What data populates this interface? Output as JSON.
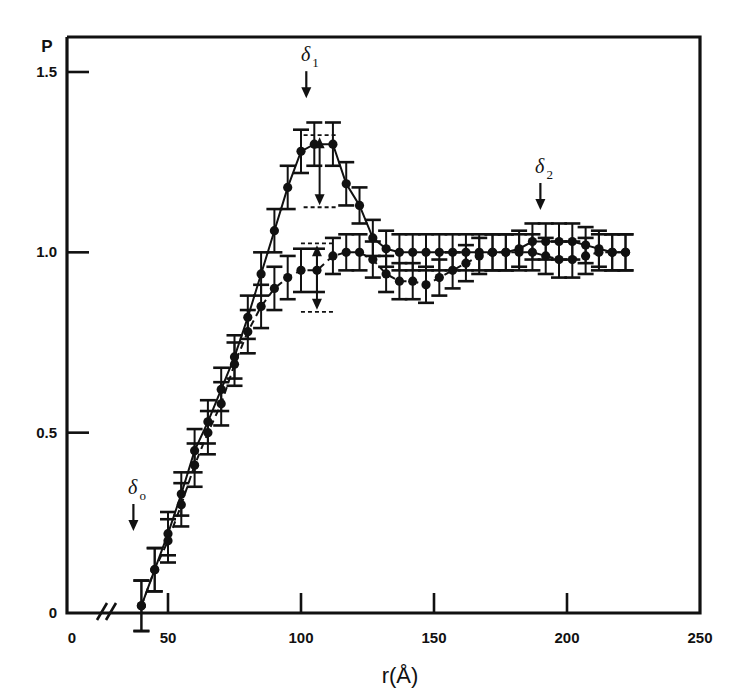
{
  "chart_data": {
    "type": "scatter",
    "title": "",
    "xlabel": "r(Å)",
    "ylabel": "P",
    "xlim": [
      0,
      250
    ],
    "ylim": [
      0,
      1.65
    ],
    "grid": false,
    "legend": "none",
    "axis_break_x": true,
    "x_ticks": [
      0,
      50,
      100,
      150,
      200,
      250
    ],
    "x_tick_labels": [
      "0",
      "50",
      "100",
      "150",
      "200",
      "250"
    ],
    "y_ticks": [
      0,
      0.5,
      1.0,
      1.5
    ],
    "y_tick_labels": [
      "0",
      "0.5",
      "1.0",
      "1.5"
    ],
    "annotations": [
      {
        "name": "delta-0",
        "label": "δ",
        "sub": "o",
        "x": 40,
        "y_label": 0.33,
        "arrow": "down"
      },
      {
        "name": "delta-1",
        "label": "δ",
        "sub": "1",
        "x": 105,
        "y_label": 1.53,
        "arrow": "down"
      },
      {
        "name": "delta-2",
        "label": "δ",
        "sub": "2",
        "x": 193,
        "y_label": 1.22,
        "arrow": "down"
      }
    ],
    "markers": [
      {
        "name": "spread-marker-upper",
        "x": 107,
        "y_top": 1.3,
        "y_bottom": 1.15
      },
      {
        "name": "spread-marker-lower",
        "x": 106,
        "y_top": 1.0,
        "y_bottom": 0.86
      }
    ],
    "series": [
      {
        "name": "upper-curve",
        "line_style": "solid",
        "x": [
          40,
          45,
          50,
          55,
          60,
          65,
          70,
          75,
          80,
          85,
          90,
          95,
          100,
          105,
          112,
          117,
          122,
          127,
          132,
          137,
          142,
          147,
          152,
          157,
          162,
          167,
          172,
          177,
          182,
          187,
          192,
          197,
          202,
          207,
          212,
          217,
          222
        ],
        "y": [
          0.02,
          0.12,
          0.22,
          0.33,
          0.45,
          0.53,
          0.62,
          0.71,
          0.82,
          0.94,
          1.06,
          1.18,
          1.28,
          1.3,
          1.3,
          1.19,
          1.13,
          1.04,
          1.01,
          1.0,
          1.0,
          1.0,
          1.0,
          1.0,
          1.0,
          1.0,
          1.0,
          1.0,
          1.01,
          1.03,
          1.03,
          1.03,
          1.03,
          1.02,
          1.01,
          1.0,
          1.0
        ],
        "yerr": [
          0.07,
          0.06,
          0.06,
          0.06,
          0.06,
          0.06,
          0.06,
          0.06,
          0.06,
          0.06,
          0.06,
          0.06,
          0.06,
          0.06,
          0.06,
          0.06,
          0.05,
          0.05,
          0.05,
          0.05,
          0.05,
          0.05,
          0.05,
          0.05,
          0.05,
          0.05,
          0.05,
          0.05,
          0.05,
          0.05,
          0.05,
          0.05,
          0.05,
          0.05,
          0.05,
          0.05,
          0.05
        ]
      },
      {
        "name": "lower-curve",
        "line_style": "dashed",
        "x": [
          40,
          45,
          50,
          55,
          60,
          65,
          70,
          75,
          80,
          85,
          90,
          95,
          100,
          106,
          112,
          117,
          122,
          127,
          132,
          137,
          142,
          147,
          152,
          157,
          162,
          167,
          172,
          177,
          182,
          187,
          192,
          197,
          202,
          207,
          212,
          217,
          222
        ],
        "y": [
          0.02,
          0.12,
          0.2,
          0.3,
          0.41,
          0.5,
          0.58,
          0.69,
          0.78,
          0.85,
          0.9,
          0.93,
          0.95,
          0.95,
          0.99,
          1.0,
          1.0,
          0.98,
          0.94,
          0.92,
          0.92,
          0.91,
          0.93,
          0.95,
          0.97,
          0.99,
          1.0,
          1.0,
          1.0,
          1.0,
          0.99,
          0.98,
          0.98,
          0.99,
          1.0,
          1.0,
          1.0
        ],
        "yerr": [
          0.07,
          0.06,
          0.06,
          0.06,
          0.06,
          0.06,
          0.06,
          0.06,
          0.06,
          0.06,
          0.06,
          0.06,
          0.06,
          0.06,
          0.05,
          0.05,
          0.05,
          0.05,
          0.05,
          0.05,
          0.05,
          0.05,
          0.05,
          0.05,
          0.05,
          0.05,
          0.05,
          0.05,
          0.05,
          0.05,
          0.05,
          0.05,
          0.05,
          0.05,
          0.05,
          0.05,
          0.05
        ]
      }
    ]
  }
}
